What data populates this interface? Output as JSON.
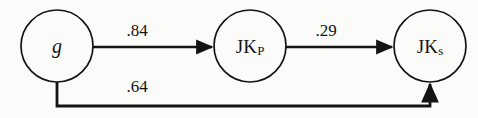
{
  "diagram": {
    "type": "path-diagram",
    "width": 478,
    "height": 118,
    "background_color": "#fbfbf9",
    "stroke_color": "#141414",
    "text_color": "#161616",
    "nodes": [
      {
        "id": "g",
        "label": "g",
        "label_style": "italic",
        "subscript": "",
        "cx": 57,
        "cy": 46,
        "r": 36
      },
      {
        "id": "jkp",
        "label": "JK",
        "label_style": "roman",
        "subscript": "P",
        "cx": 250,
        "cy": 46,
        "r": 36
      },
      {
        "id": "jks",
        "label": "JK",
        "label_style": "roman",
        "subscript": "s",
        "cx": 430,
        "cy": 46,
        "r": 36
      }
    ],
    "paths": [
      {
        "id": "g-to-jkp",
        "from": "g",
        "to": "jkp",
        "coefficient": ".84",
        "label_x": 137,
        "label_y": 30,
        "shape": "straight-horizontal",
        "arrowhead": "end"
      },
      {
        "id": "jkp-to-jks",
        "from": "jkp",
        "to": "jks",
        "coefficient": ".29",
        "label_x": 326,
        "label_y": 30,
        "shape": "straight-horizontal",
        "arrowhead": "end"
      },
      {
        "id": "g-to-jks",
        "from": "g",
        "to": "jks",
        "coefficient": ".64",
        "label_x": 137,
        "label_y": 86,
        "shape": "elbow-below",
        "arrowhead": "end"
      }
    ]
  }
}
